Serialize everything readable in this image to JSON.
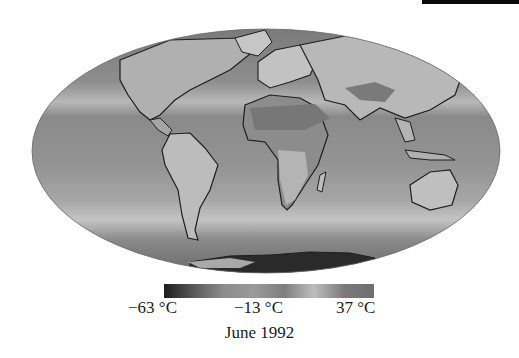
{
  "figure": {
    "caption": "June 1992",
    "projection": "Mollweide global map",
    "variable": "surface temperature (grayscale)"
  },
  "colorbar": {
    "min_label": "−63 °C",
    "mid_label": "−13 °C",
    "max_label": "37 °C",
    "min_value": -63,
    "mid_value": -13,
    "max_value": 37,
    "stops": [
      "#1c1c1c",
      "#5a5a5a",
      "#8c8c8c",
      "#9a9a9a",
      "#7e7e7e",
      "#bdbdbd",
      "#7a7a7a",
      "#6e6e6e"
    ]
  },
  "colors": {
    "ocean": "#8a8a8a",
    "land_warm": "#6a6a6a",
    "land_light": "#bcbcbc",
    "coastline": "#1e1e1e",
    "antarctica": "#2a2a2a"
  }
}
